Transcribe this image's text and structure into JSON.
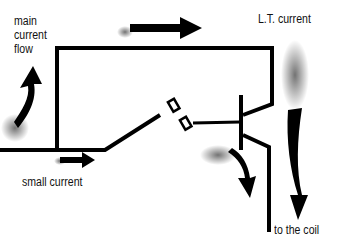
{
  "labels": {
    "main_current_flow": [
      "main",
      "current",
      "flow"
    ],
    "lt_current": "L.T. current",
    "small_current": "small current",
    "to_the_coil": "to the coil"
  },
  "colors": {
    "line": "#000000",
    "background": "#ffffff"
  }
}
